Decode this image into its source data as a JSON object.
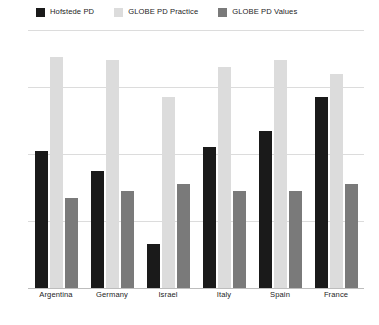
{
  "chart_data": {
    "type": "bar",
    "title": "",
    "subtitle": "",
    "xlabel": "",
    "ylabel": "",
    "ylim": [
      0,
      77
    ],
    "grid": true,
    "gridlines": [
      20,
      40,
      60,
      77
    ],
    "legend_position": "top-left",
    "categories": [
      "Argentina",
      "Germany",
      "Israel",
      "Italy",
      "Spain",
      "France"
    ],
    "series": [
      {
        "name": "Hofstede PD",
        "color": "#1a1a1a",
        "values": [
          41,
          35,
          13,
          42,
          47,
          57
        ]
      },
      {
        "name": "GLOBE PD Practice",
        "color": "#dcdcdc",
        "values": [
          69,
          68,
          57,
          66,
          68,
          64
        ]
      },
      {
        "name": "GLOBE PD Values",
        "color": "#7a7a7a",
        "values": [
          27,
          29,
          31,
          29,
          29,
          31
        ]
      }
    ]
  },
  "legend": {
    "items": [
      {
        "label": "Hofstede PD",
        "color": "#1a1a1a"
      },
      {
        "label": "GLOBE PD Practice",
        "color": "#dcdcdc"
      },
      {
        "label": "GLOBE PD Values",
        "color": "#7a7a7a"
      }
    ]
  },
  "axis": {
    "categories": [
      "Argentina",
      "Germany",
      "Israel",
      "Italy",
      "Spain",
      "France"
    ]
  },
  "colors": {
    "background": "#ffffff",
    "gridline": "#dcdcdc",
    "baseline": "#bdbdbd",
    "text": "#1d1d1d"
  }
}
